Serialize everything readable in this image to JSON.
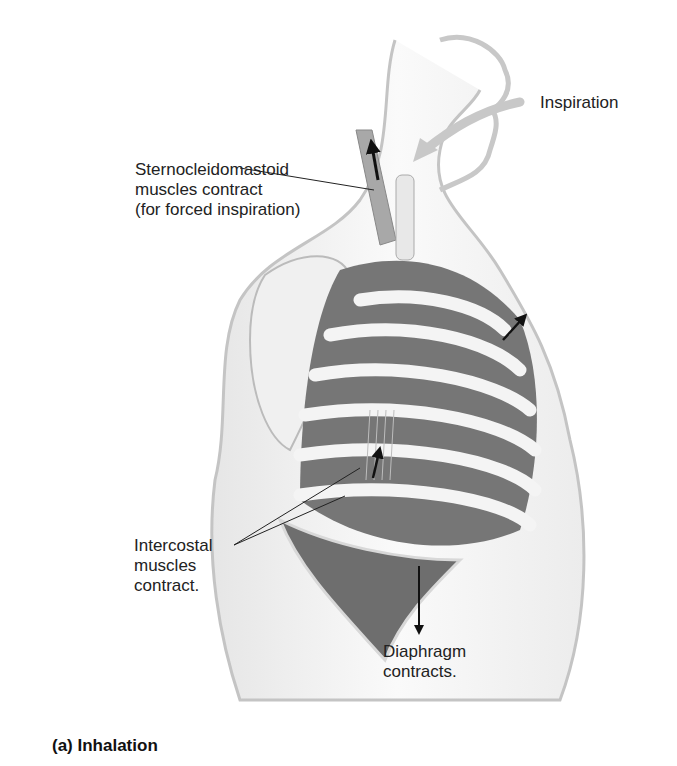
{
  "figure": {
    "caption": "(a) Inhalation",
    "colors": {
      "background": "#ffffff",
      "outline": "#b8b8b8",
      "rib": "#f2f2f2",
      "intercostal": "#6e6e6e",
      "diaphragm": "#707070",
      "arrow": "#111111",
      "airflow": "#c8c8c8",
      "text": "#222222"
    },
    "labels": {
      "inspiration": "Inspiration",
      "scm_line1": "Sternocleidomastoid",
      "scm_line2": "muscles contract",
      "scm_line3": "(for forced inspiration)",
      "intercostal_line1": "Intercostal",
      "intercostal_line2": "muscles",
      "intercostal_line3": "contract.",
      "diaphragm_line1": "Diaphragm",
      "diaphragm_line2": "contracts."
    }
  }
}
